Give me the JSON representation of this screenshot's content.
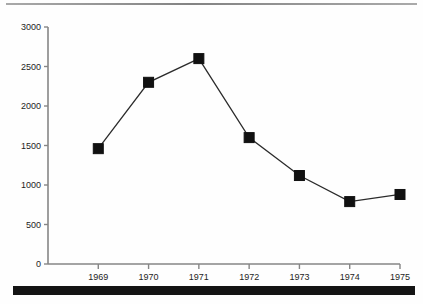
{
  "page": {
    "top_rule_color": "#7a7a7a",
    "bottom_bar_color": "#141414",
    "background_color": "#fefefe"
  },
  "chart_data": {
    "type": "line",
    "title": "",
    "subtitle": "",
    "xlabel": "",
    "ylabel": "",
    "categories": [
      "1969",
      "1970",
      "1971",
      "1972",
      "1973",
      "1974",
      "1975"
    ],
    "x": [
      1969,
      1970,
      1971,
      1972,
      1973,
      1974,
      1975
    ],
    "values": [
      1460,
      2300,
      2600,
      1600,
      1120,
      790,
      880
    ],
    "series": [
      {
        "name": "",
        "values": [
          1460,
          2300,
          2600,
          1600,
          1120,
          790,
          880
        ],
        "line_color": "#2b2b2b",
        "marker": "square",
        "marker_color": "#111111"
      }
    ],
    "ylim": [
      0,
      3000
    ],
    "y_ticks": [
      0,
      500,
      1000,
      1500,
      2000,
      2500,
      3000
    ],
    "y_tick_labels": [
      "0",
      "500",
      "1000",
      "1500",
      "2000",
      "2500",
      "3000"
    ],
    "x_tick_labels": [
      "1969",
      "1970",
      "1971",
      "1972",
      "1973",
      "1974",
      "1975"
    ],
    "grid": false,
    "legend": false,
    "legend_position": "none",
    "axis_color": "#868686"
  }
}
